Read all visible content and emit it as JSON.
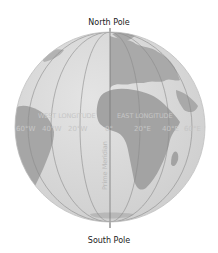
{
  "labels": {
    "north_pole": "North Pole",
    "south_pole": "South Pole",
    "west_longitude": "WEST LONGITUDE",
    "east_longitude": "EAST LONGITUDE",
    "prime_meridian": "Prime Meridian"
  },
  "longitude_ticks": {
    "w60": "60°W",
    "w40": "40°W",
    "w20": "20°W",
    "zero": "0°",
    "e20": "20°E",
    "e40": "40°E",
    "e60": "60°E"
  },
  "colors": {
    "ocean": "#d9d9d9",
    "land": "#a6a6a6",
    "meridian_lines": "#8c8c8c",
    "label_text": "#c6c6c6"
  }
}
